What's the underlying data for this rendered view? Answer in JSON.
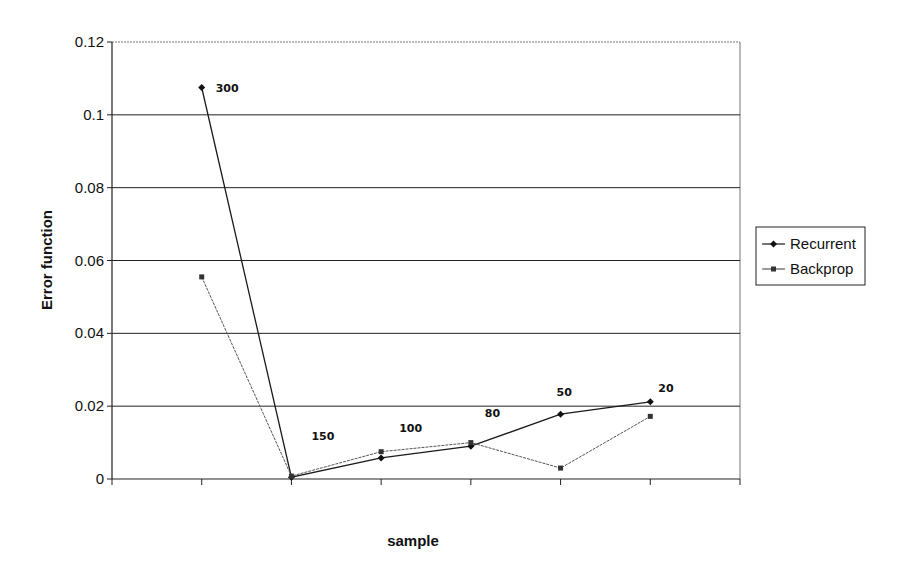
{
  "chart_data": {
    "type": "line",
    "title": "",
    "xlabel": "sample",
    "ylabel": "Error function",
    "ylim": [
      0,
      0.12
    ],
    "yticks": [
      "0",
      "0.02",
      "0.04",
      "0.06",
      "0.08",
      "0.1",
      "0.12"
    ],
    "grid": true,
    "legend_position": "right",
    "categories": [
      "300",
      "150",
      "100",
      "80",
      "50",
      "20"
    ],
    "point_labels": [
      "300",
      "150",
      "100",
      "80",
      "50",
      "20"
    ],
    "series": [
      {
        "name": "Recurrent",
        "marker": "diamond",
        "color": "#1a1a1a",
        "values": [
          0.1075,
          0.0005,
          0.0058,
          0.009,
          0.0178,
          0.0212
        ]
      },
      {
        "name": "Backprop",
        "marker": "square",
        "color": "#555555",
        "values": [
          0.0555,
          0.0008,
          0.0075,
          0.01,
          0.003,
          0.0172
        ]
      }
    ]
  },
  "legend": {
    "items": [
      {
        "label": "Recurrent"
      },
      {
        "label": "Backprop"
      }
    ]
  }
}
